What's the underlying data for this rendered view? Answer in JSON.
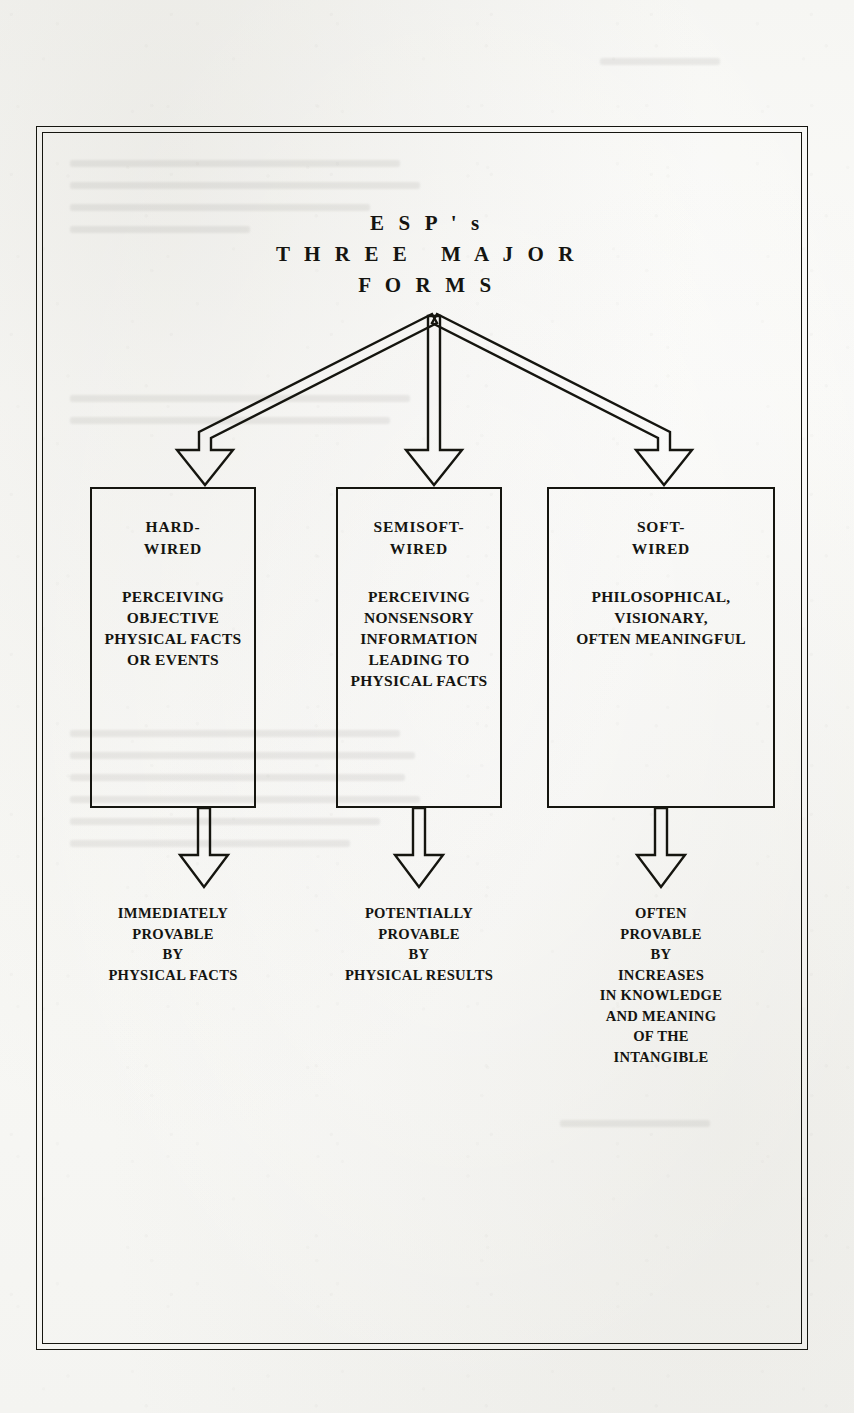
{
  "page": {
    "background_color": "#f7f7f4",
    "ink_color": "#141410"
  },
  "diagram": {
    "title_lines": [
      "E S P ' s",
      "T H R E E   M A J O R",
      "F O R M S"
    ],
    "title_plain": "ESP's THREE MAJOR FORMS",
    "branches": [
      {
        "id": "hard-wired",
        "box_title": [
          "HARD-",
          "WIRED"
        ],
        "box_body": [
          "PERCEIVING",
          "OBJECTIVE",
          "PHYSICAL FACTS",
          "OR EVENTS"
        ],
        "outcome": [
          "IMMEDIATELY",
          "PROVABLE",
          "BY",
          "PHYSICAL FACTS"
        ]
      },
      {
        "id": "semisoft-wired",
        "box_title": [
          "SEMISOFT-",
          "WIRED"
        ],
        "box_body": [
          "PERCEIVING",
          "NONSENSORY",
          "INFORMATION",
          "LEADING TO",
          "PHYSICAL FACTS"
        ],
        "outcome": [
          "POTENTIALLY",
          "PROVABLE",
          "BY",
          "PHYSICAL RESULTS"
        ]
      },
      {
        "id": "soft-wired",
        "box_title": [
          "SOFT-",
          "WIRED"
        ],
        "box_body": [
          "PHILOSOPHICAL,",
          "VISIONARY,",
          "OFTEN MEANINGFUL"
        ],
        "outcome": [
          "OFTEN",
          "PROVABLE",
          "BY",
          "INCREASES",
          "IN KNOWLEDGE",
          "AND MEANING",
          "OF THE",
          "INTANGIBLE"
        ]
      }
    ]
  }
}
